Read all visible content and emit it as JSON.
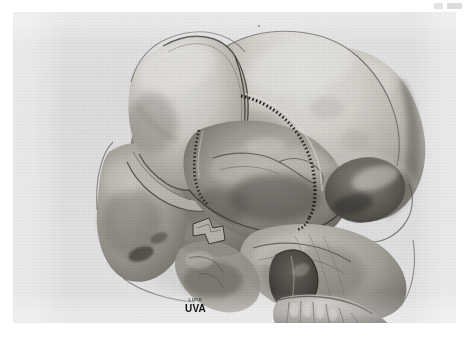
{
  "page": {
    "background_color": "#ffffff",
    "plate_background_color": "#f1f1f1",
    "corner_mark": "scanner-edge-mark"
  },
  "plate": {
    "type": "halftone-photograph",
    "subject": "human skull, oblique anterosuperior view",
    "technique": "airbrush / carbon dust medical illustration, grayscale halftone reproduction",
    "ink_color": "#2b2b2b",
    "bone_highlight_color": "#e8e6e2",
    "bone_midtone_color": "#b9b6b1",
    "bone_shadow_color": "#6d6a66",
    "deep_shadow_color": "#3a3835"
  },
  "illustration": {
    "title": "Craniofacial exposure with reflected frontal bone flap",
    "described_structures": [
      "frontal bone flap, reflected anteroinferiorly",
      "cranial vault / parietal bone",
      "dotted osteotomy line along bone flap margin",
      "supraorbital rim",
      "orbital roof and anterior cranial fossa floor",
      "greater wing of sphenoid",
      "lateral orbital wall",
      "zygomatic arch",
      "nasal aperture",
      "maxilla with dentition",
      "temporal fossa"
    ],
    "osteotomy_line_style": "dotted",
    "osteotomy_line_color": "#16140f"
  },
  "signature": {
    "credit_line": "LUCE",
    "institution": "UVA"
  }
}
